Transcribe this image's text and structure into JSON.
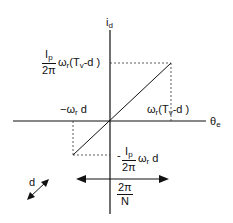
{
  "diagram": {
    "y_axis_label": {
      "main": "i",
      "sub": "d"
    },
    "x_axis_label": {
      "main": "θ",
      "sub": "e"
    },
    "top_left_label": {
      "frac_num": "I",
      "frac_num_sub": "p",
      "frac_den": "2π",
      "omega": "ω",
      "omega_sub": "r",
      "rest_a": "(T",
      "rest_sub": "v",
      "rest_b": "-d )"
    },
    "neg_x_label": {
      "pre": "−ω",
      "sub": "r",
      "post": " d"
    },
    "pos_x_label": {
      "pre": "ω",
      "sub": "r",
      "mid": "(T",
      "sub2": "v",
      "post": "-d )"
    },
    "bottom_label": {
      "minus": "-",
      "frac_num": "I",
      "frac_num_sub": "p",
      "frac_den": "2π",
      "omega": "ω",
      "omega_sub": "r",
      "post": " d"
    },
    "d_label": "d",
    "period_label": {
      "num": "2π",
      "den": "N"
    }
  }
}
